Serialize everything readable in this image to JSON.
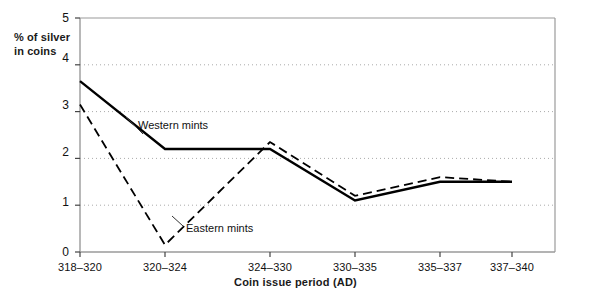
{
  "chart_data": {
    "type": "line",
    "title": "",
    "xlabel": "Coin issue period  (AD)",
    "ylabel": "% of silver\nin coins",
    "categories": [
      "318–320",
      "320–324",
      "324–330",
      "330–335",
      "335–337",
      "337–340"
    ],
    "ylim": [
      0,
      5
    ],
    "yticks": [
      "0",
      "1",
      "2",
      "3",
      "4",
      "5"
    ],
    "grid": true,
    "grid_style": "dotted-horizontal",
    "legend": "inline-annotations",
    "series": [
      {
        "name": "Western mints",
        "style": "solid",
        "color": "#000000",
        "values": [
          3.65,
          2.2,
          2.2,
          1.1,
          1.5,
          1.5
        ]
      },
      {
        "name": "Eastern mints",
        "style": "dashed",
        "color": "#000000",
        "values": [
          3.15,
          0.15,
          2.35,
          1.2,
          1.6,
          1.5
        ]
      }
    ],
    "annotations": [
      {
        "text": "Western mints",
        "series": "Western mints"
      },
      {
        "text": "Eastern mints",
        "series": "Eastern mints"
      }
    ]
  },
  "axes": {
    "y_axis_label_line1": "% of silver",
    "y_axis_label_line2": "in coins",
    "y_ticks": [
      "5",
      "4",
      "3",
      "2",
      "1",
      "0"
    ],
    "x_ticks": [
      "318–320",
      "320–324",
      "324–330",
      "330–335",
      "335–337",
      "337–340"
    ],
    "x_axis_title": "Coin issue period  (AD)"
  },
  "annotations": {
    "western": "Western mints",
    "eastern": "Eastern mints"
  },
  "colors": {
    "line": "#000000",
    "frame": "#9a9a9a",
    "grid": "#aaaaaa",
    "background": "#ffffff"
  }
}
